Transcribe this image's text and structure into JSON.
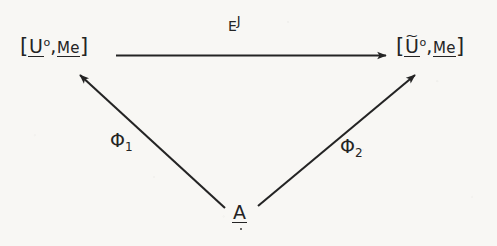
{
  "figure": {
    "kind": "commutative-diagram",
    "background_color": "#f8f7f4",
    "ink_color": "#242424",
    "width": 497,
    "height": 246
  },
  "nodes": {
    "left": {
      "open_bracket": "[",
      "base": "U",
      "accent": "",
      "superscript": "o",
      "comma": ",",
      "second": "Me",
      "close_bracket": "]",
      "plain_text": "[U°,Me]"
    },
    "right": {
      "open_bracket": "[",
      "base": "U",
      "accent": "~",
      "superscript": "o",
      "comma": ",",
      "second": "Me",
      "close_bracket": "]",
      "plain_text": "[Ũ°,Me]"
    },
    "bottom": {
      "base": "A",
      "plain_text": "A"
    }
  },
  "edges": {
    "top": {
      "label_base": "E",
      "label_superscript": "J",
      "plain_text": "E^J",
      "direction": "left-to-right"
    },
    "left_diagonal": {
      "label_base": "Φ",
      "label_subscript": "1",
      "plain_text": "Φ₁",
      "direction": "A-to-left-node"
    },
    "right_diagonal": {
      "label_base": "Φ",
      "label_subscript": "2",
      "plain_text": "Φ₂",
      "direction": "A-to-right-node"
    }
  }
}
